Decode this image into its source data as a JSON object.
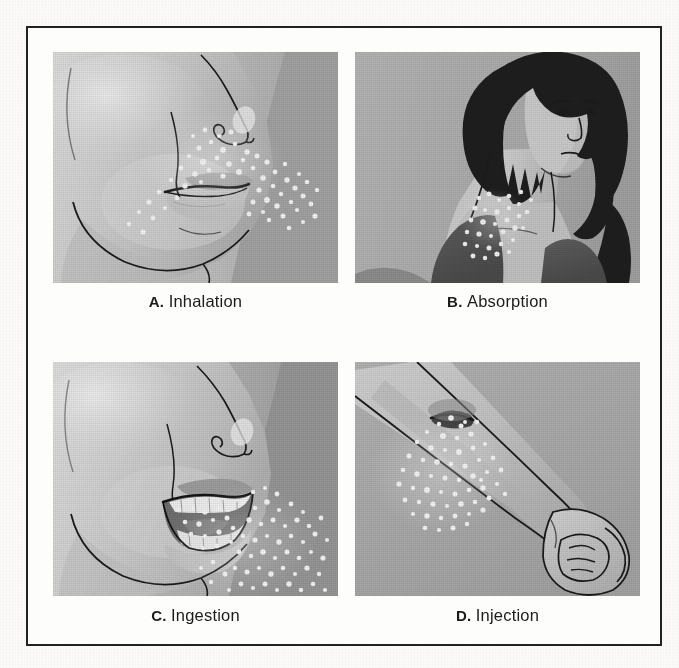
{
  "figure": {
    "frame_border_color": "#222222",
    "page_background": "#fbfaf8",
    "panels": [
      {
        "id": "a",
        "letter": "A.",
        "label": "Inhalation",
        "caption": "A. Inhalation",
        "scene": "side profile of a face showing nose and lips with a cloud of fine white particles drifting toward the nostrils and mouth",
        "skin_light": "#d2d2d2",
        "skin_mid": "#b6b6b6",
        "skin_shadow": "#9a9a9a",
        "background": "#b8b8b8",
        "line_color": "#1b1b1b",
        "particle_color": "#f2f2f2",
        "particle_count": 84
      },
      {
        "id": "b",
        "letter": "B.",
        "label": "Absorption",
        "caption": "B. Absorption",
        "scene": "woman with a dark bobbed haircut turning her head, wearing a dark top, with white particles settling on the exposed skin of her neck",
        "skin_light": "#c9c9c9",
        "skin_mid": "#b0b0b0",
        "skin_shadow": "#8f8f8f",
        "hair_color": "#1e1e1e",
        "garment_color": "#555555",
        "background": "#b0b0b0",
        "line_color": "#1b1b1b",
        "particle_color": "#f0f0f0",
        "particle_count": 46
      },
      {
        "id": "c",
        "letter": "C.",
        "label": "Ingestion",
        "caption": "C. Ingestion",
        "scene": "side profile of a face with the mouth open showing teeth, white particles entering the mouth and scattering across the cheek and jaw",
        "skin_light": "#d4d4d4",
        "skin_mid": "#b8b8b8",
        "skin_shadow": "#9b9b9b",
        "background": "#9f9f9f",
        "line_color": "#1b1b1b",
        "teeth_color": "#efefef",
        "mouth_interior": "#6f6f6f",
        "particle_color": "#f2f2f2",
        "particle_count": 112
      },
      {
        "id": "d",
        "letter": "D.",
        "label": "Injection",
        "caption": "D. Injection",
        "scene": "a bare forearm with a clenched fist, showing a puncture wound on the inner forearm with white particles spreading out from the injection site",
        "skin_light": "#c6c6c6",
        "skin_mid": "#b2b2b2",
        "skin_shadow": "#979797",
        "background": "#a8a8a8",
        "line_color": "#1b1b1b",
        "wound_color": "#3a3a3a",
        "particle_color": "#f3f3f3",
        "particle_count": 78
      }
    ]
  }
}
